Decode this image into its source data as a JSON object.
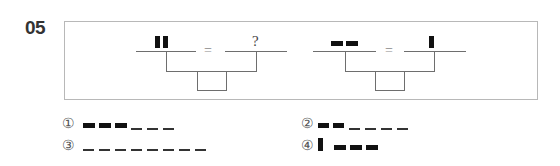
{
  "question": {
    "number": "05"
  },
  "puzzle": {
    "equation_1": {
      "left_symbol": "two tall black bars",
      "equals": "=",
      "right_symbol": "?"
    },
    "equation_2": {
      "left_symbol": "two wide black bars",
      "equals": "=",
      "right_symbol": "one tall black bar"
    }
  },
  "options": [
    {
      "marker": "①",
      "description": "three wide bars and three short dashes"
    },
    {
      "marker": "②",
      "description": "two wide bars and four short dashes"
    },
    {
      "marker": "③",
      "description": "eight short dashes"
    },
    {
      "marker": "④",
      "description": "one tall bar and three wide bars"
    }
  ],
  "colors": {
    "ink": "#111111",
    "line": "#6e6e6e",
    "frame": "#b8b8b8"
  }
}
